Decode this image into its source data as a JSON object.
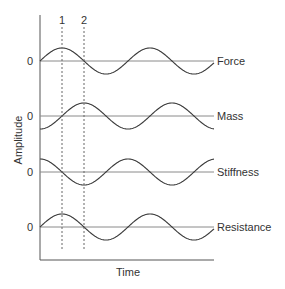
{
  "chart_data": {
    "type": "line",
    "title": "",
    "xlabel": "Time",
    "ylabel": "Amplitude",
    "markers": [
      {
        "label": "1",
        "x_px": 62
      },
      {
        "label": "2",
        "x_px": 84
      }
    ],
    "zero_label": "0",
    "period_px": 88,
    "amplitude_px": 13,
    "series": [
      {
        "name": "Force",
        "baseline_y": 61,
        "phase_deg": 0
      },
      {
        "name": "Mass",
        "baseline_y": 116,
        "phase_deg": -90
      },
      {
        "name": "Stiffness",
        "baseline_y": 172,
        "phase_deg": 90
      },
      {
        "name": "Resistance",
        "baseline_y": 227,
        "phase_deg": 0
      }
    ],
    "grid": false,
    "legend": "inline-right"
  },
  "colors": {
    "curve": "#3a3a3a",
    "baseline": "#8a8a8a",
    "axis": "#555555",
    "text": "#333333"
  }
}
